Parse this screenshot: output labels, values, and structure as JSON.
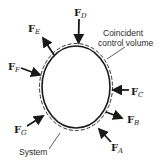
{
  "diagram": {
    "annotations": {
      "control_volume_line1": "Coincident",
      "control_volume_line2": "control volume",
      "system": "System"
    },
    "forces": [
      {
        "id": "A",
        "symbol": "F",
        "subscript": "A"
      },
      {
        "id": "B",
        "symbol": "F",
        "subscript": "B"
      },
      {
        "id": "C",
        "symbol": "F",
        "subscript": "C"
      },
      {
        "id": "D",
        "symbol": "F",
        "subscript": "D"
      },
      {
        "id": "E",
        "symbol": "F",
        "subscript": "E"
      },
      {
        "id": "F",
        "symbol": "F",
        "subscript": "F"
      },
      {
        "id": "G",
        "symbol": "F",
        "subscript": "G"
      }
    ],
    "colors": {
      "stroke": "#1a1a1a",
      "background": "#ffffff"
    }
  }
}
